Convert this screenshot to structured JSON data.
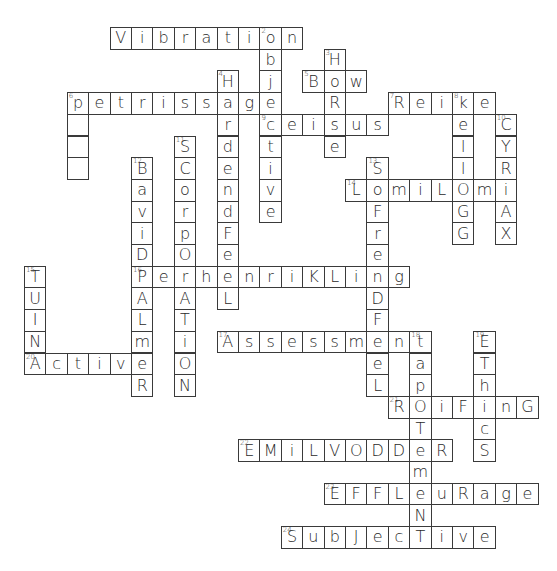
{
  "puzzle": {
    "type": "crossword",
    "origin": {
      "x": 24,
      "y": 27
    },
    "cell": {
      "w": 21.4,
      "h": 21.7
    },
    "words": [
      {
        "number": "",
        "answer": "Vibration",
        "dir": "across",
        "row": 0,
        "col": 2
      },
      {
        "number": "2",
        "answer": "objective",
        "dir": "down",
        "row": 0,
        "col": 9
      },
      {
        "number": "3",
        "answer": "HoRse",
        "dir": "down",
        "row": 1,
        "col": 12
      },
      {
        "number": "4",
        "answer": "HardendFeeL",
        "dir": "down",
        "row": 2,
        "col": 7
      },
      {
        "number": "5",
        "answer": "Bow",
        "dir": "across",
        "row": 2,
        "col": 11
      },
      {
        "number": "6",
        "answer": "petrissage",
        "dir": "across",
        "row": 3,
        "col": 0
      },
      {
        "number": "",
        "answer": "   ",
        "dir": "down",
        "row": 4,
        "col": 0
      },
      {
        "number": "7",
        "answer": "Reike",
        "dir": "across",
        "row": 3,
        "col": 15
      },
      {
        "number": "8",
        "answer": "KellOGG",
        "dir": "down",
        "row": 3,
        "col": 18
      },
      {
        "number": "9",
        "answer": "ceisus",
        "dir": "across",
        "row": 4,
        "col": 9
      },
      {
        "number": "10",
        "answer": "CYRiAX",
        "dir": "down",
        "row": 4,
        "col": 20
      },
      {
        "number": "11",
        "answer": "SCorpOrATiON",
        "dir": "down",
        "row": 5,
        "col": 5
      },
      {
        "number": "12",
        "answer": "BaviDPALmeR",
        "dir": "down",
        "row": 6,
        "col": 3
      },
      {
        "number": "13",
        "answer": "SoFrenDFeeL",
        "dir": "down",
        "row": 6,
        "col": 14
      },
      {
        "number": "14",
        "answer": "LomiLOmi",
        "dir": "across",
        "row": 7,
        "col": 13
      },
      {
        "number": "15",
        "answer": "TUINA",
        "dir": "down",
        "row": 11,
        "col": -2
      },
      {
        "number": "16",
        "answer": "PerhenriKLing",
        "dir": "across",
        "row": 11,
        "col": 3
      },
      {
        "number": "17",
        "answer": "Assessment",
        "dir": "across",
        "row": 14,
        "col": 7
      },
      {
        "number": "18",
        "answer": "TapOTemeNT",
        "dir": "down",
        "row": 14,
        "col": 16
      },
      {
        "number": "19",
        "answer": "EThicS",
        "dir": "down",
        "row": 14,
        "col": 19
      },
      {
        "number": "20",
        "answer": "ActivE",
        "dir": "across",
        "row": 15,
        "col": -2
      },
      {
        "number": "21",
        "answer": "ROiFinG",
        "dir": "across",
        "row": 17,
        "col": 15
      },
      {
        "number": "22",
        "answer": "EMiLVODDeR",
        "dir": "across",
        "row": 19,
        "col": 8
      },
      {
        "number": "23",
        "answer": "EFFLeuRage",
        "dir": "across",
        "row": 21,
        "col": 12
      },
      {
        "number": "24",
        "answer": "SubJecTive",
        "dir": "across",
        "row": 23,
        "col": 10
      }
    ]
  }
}
